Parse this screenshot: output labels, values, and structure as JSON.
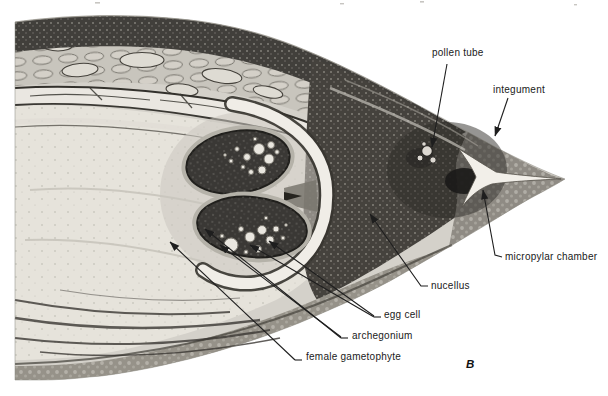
{
  "figure": {
    "panel_letter": "B",
    "labels": {
      "pollen_tube": "pollen tube",
      "integument": "integument",
      "micropylar_chamber": "micropylar chamber",
      "nucellus": "nucellus",
      "egg_cell": "egg cell",
      "archegonium": "archegonium",
      "female_gametophyte": "female gametophyte"
    },
    "colors": {
      "background": "#ffffff",
      "label_ink": "#1a1a1a",
      "tissue_dark": "#3a3835",
      "tissue_mid_gray": "#8f8b84",
      "tissue_pale": "#e6e3db"
    }
  }
}
